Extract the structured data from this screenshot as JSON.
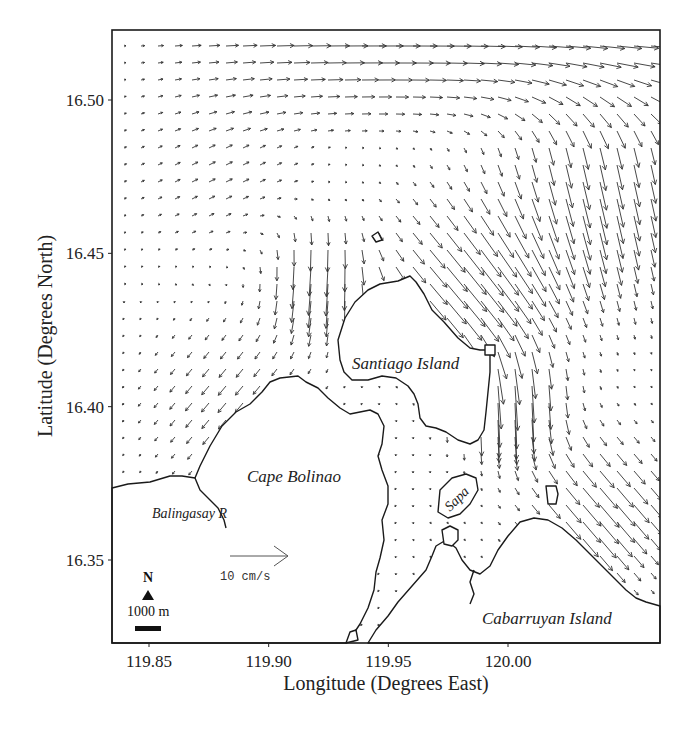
{
  "figure": {
    "type": "current-vector-map",
    "x_axis": {
      "title": "Longitude (Degrees East)",
      "ticks": [
        {
          "label": "119.85",
          "value": 119.85
        },
        {
          "label": "119.90",
          "value": 119.9
        },
        {
          "label": "119.95",
          "value": 119.95
        },
        {
          "label": "120.00",
          "value": 120.0
        }
      ]
    },
    "y_axis": {
      "title": "Latitude (Degrees North)",
      "ticks": [
        {
          "label": "16.50",
          "value": 16.5
        },
        {
          "label": "16.45",
          "value": 16.45
        },
        {
          "label": "16.40",
          "value": 16.4
        },
        {
          "label": "16.35",
          "value": 16.35
        }
      ]
    },
    "places": [
      {
        "id": "santiago",
        "label": "Santiago Island"
      },
      {
        "id": "cape",
        "label": "Cape Bolinao"
      },
      {
        "id": "balingasay",
        "label": "Balingasay R"
      },
      {
        "id": "cabarruyan",
        "label": "Cabarruyan Island"
      },
      {
        "id": "sapa",
        "label": "Sapa"
      }
    ],
    "reference_vector": {
      "label": "10 cm/s",
      "magnitude_cm_s": 10
    },
    "north_arrow": {
      "label": "N"
    },
    "scale_bar": {
      "label": "1000 m"
    }
  },
  "chart_data": {
    "type": "vector-field",
    "title": "",
    "xlabel": "Longitude (Degrees East)",
    "ylabel": "Latitude (Degrees North)",
    "xlim": [
      119.835,
      120.035
    ],
    "ylim": [
      16.325,
      16.52
    ],
    "xticks": [
      119.85,
      119.9,
      119.95,
      120.0
    ],
    "yticks": [
      16.35,
      16.4,
      16.45,
      16.5
    ],
    "grid": false,
    "reference_vector_cm_s": 10,
    "annotations": [
      "Santiago Island",
      "Cape Bolinao",
      "Balingasay R",
      "Cabarruyan Island",
      "Sapa",
      "10 cm/s",
      "N",
      "1000 m"
    ],
    "flow_summary": [
      {
        "region": "northern boundary (16.50-16.52 N)",
        "direction": "east",
        "speed_cm_s": "5-8"
      },
      {
        "region": "north-east corner (120.00-120.03 E)",
        "direction": "south / south-east",
        "speed_cm_s": "4-8"
      },
      {
        "region": "channel north-east of Santiago Island",
        "direction": "south-east",
        "speed_cm_s": "8-12"
      },
      {
        "region": "east of Santiago Island (119.98-119.99 E)",
        "direction": "south",
        "speed_cm_s": "10-14"
      },
      {
        "region": "west of Santiago Island (119.91-119.93 E)",
        "direction": "south",
        "speed_cm_s": "6-10"
      },
      {
        "region": "west basin near Cape Bolinao",
        "direction": "south-west",
        "speed_cm_s": "2-4"
      },
      {
        "region": "north-west of Cabarruyan Island",
        "direction": "south-east",
        "speed_cm_s": "6-10"
      },
      {
        "region": "channel between Santiago and Cabarruyan",
        "direction": "weak / variable",
        "speed_cm_s": "0-2"
      }
    ]
  }
}
